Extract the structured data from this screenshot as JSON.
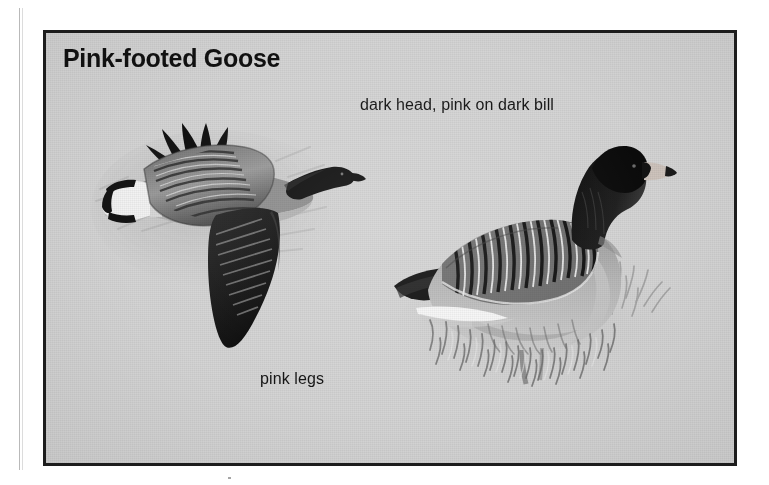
{
  "page": {
    "background_color": "#ffffff",
    "gutter_rule": "vertical-margin-rule"
  },
  "plate": {
    "title": "Pink-footed Goose",
    "frame_color": "#1d1d1d",
    "background_color": "#d4d4d4",
    "medium": "grayscale field-guide illustration"
  },
  "callouts": [
    {
      "id": "head-bill",
      "text": "dark head, pink on dark bill",
      "points_to": "standing-goose-head"
    },
    {
      "id": "legs",
      "text": "pink legs",
      "points_to": "standing-goose-legs"
    }
  ],
  "illustrations": [
    {
      "id": "flying-goose",
      "name": "pink-footed-goose-in-flight",
      "pose": "flying, facing right",
      "features": [
        "dark head and neck",
        "pointed dark bill",
        "white uppertail coverts with dark tail band",
        "barred gray wing coverts",
        "long dark primaries swept down and back"
      ]
    },
    {
      "id": "standing-goose",
      "name": "pink-footed-goose-standing",
      "pose": "standing on grass, facing right",
      "features": [
        "dark brown head and neck",
        "pink band on dark bill",
        "barred back with pale feather edges",
        "white flank stripe",
        "dark tail",
        "pink legs hidden in grass"
      ]
    }
  ],
  "colors": {
    "ink": "#141414",
    "plate_gray": "#d4d4d4",
    "shadow_gray": "#8d8d8d",
    "highlight": "#f4f4f4",
    "bill_pink": "#c9bdb6"
  }
}
